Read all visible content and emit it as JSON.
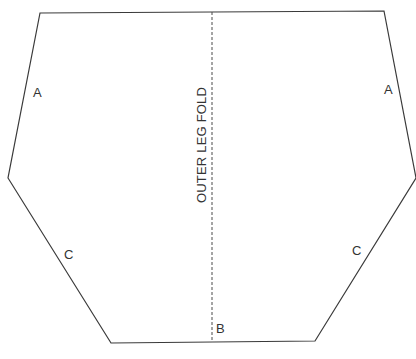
{
  "diagram": {
    "fold_label": "OUTER LEG FOLD",
    "edge_labels": {
      "a_left": "A",
      "a_right": "A",
      "c_left": "C",
      "c_right": "C",
      "b": "B"
    },
    "shape_points": "40,13 384,11 416,178 315,341 111,343 8,178",
    "fold_line": {
      "x": 212,
      "y1": 12,
      "y2": 342
    },
    "colors": {
      "stroke": "#3a3a3a",
      "text": "#333333",
      "background": "#ffffff"
    }
  }
}
